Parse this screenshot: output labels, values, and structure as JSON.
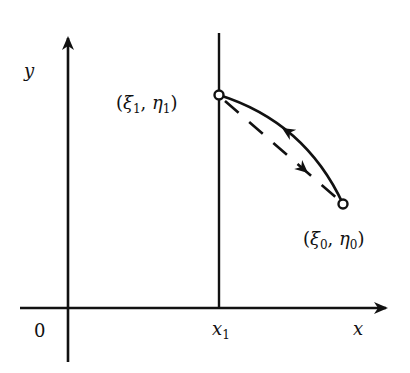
{
  "diagram": {
    "type": "coordinate-sketch",
    "axes": {
      "x_label": "x",
      "y_label": "y",
      "origin_label": "0"
    },
    "vertical_line": {
      "label_base": "x",
      "label_sub": "1"
    },
    "points": [
      {
        "id": "p1",
        "sym1": "ξ",
        "sub1": "1",
        "sym2": "η",
        "sub2": "1",
        "open": "(",
        "comma": ", ",
        "close": ")"
      },
      {
        "id": "p0",
        "sym1": "ξ",
        "sub1": "0",
        "sym2": "η",
        "sub2": "0",
        "open": "(",
        "comma": ", ",
        "close": ")"
      }
    ],
    "curves": [
      {
        "name": "solid-arc",
        "style": "solid",
        "from": "p0",
        "to": "p1",
        "arrow_direction": "toward p1"
      },
      {
        "name": "dashed-chord",
        "style": "dashed",
        "from": "p1",
        "to": "p0",
        "arrow_direction": "toward p0"
      }
    ],
    "colors": {
      "ink": "#111111",
      "background": "#ffffff"
    }
  }
}
